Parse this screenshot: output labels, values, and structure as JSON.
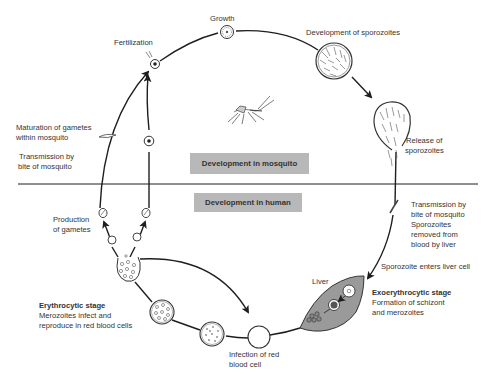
{
  "diagram": {
    "title_fragment": "y",
    "title_fragment_right": "g",
    "banners": {
      "mosquito": "Development in mosquito",
      "human": "Development in human"
    },
    "labels": {
      "growth": "Growth",
      "fertilization": "Fertilization",
      "development_sporozoites": "Development of sporozoites",
      "release_sporozoites_1": "Release of",
      "release_sporozoites_2": "sporozoites",
      "maturation_1": "Maturation of gametes",
      "maturation_2": "within mosquito",
      "transmission_left_1": "Transmission by",
      "transmission_left_2": "bite of mosquito",
      "production_1": "Production",
      "production_2": "of gametes",
      "transmission_right_1": "Transmission by",
      "transmission_right_2": "bite of mosquito",
      "transmission_right_3": "Sporozoites",
      "transmission_right_4": "removed from",
      "transmission_right_5": "blood by liver",
      "sporozoite_enters": "Sporozoite enters liver cell",
      "liver": "Liver",
      "exo_title": "Exoerythrocytic stage",
      "exo_desc_1": "Formation of schizont",
      "exo_desc_2": "and merozoites",
      "ery_title": "Erythrocytic stage",
      "ery_desc_1": "Merozoites infect and",
      "ery_desc_2": "reproduce in red blood cells",
      "infection_1": "Infection of red",
      "infection_2": "blood cell"
    },
    "colors": {
      "line": "#1e1e1e",
      "banner": "#b8b8b8",
      "liver": "#9a9a9a"
    }
  }
}
